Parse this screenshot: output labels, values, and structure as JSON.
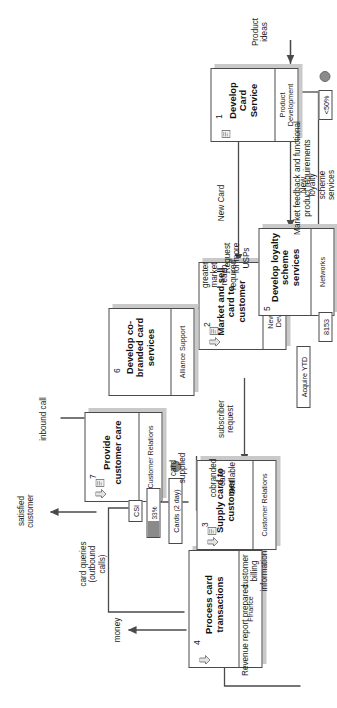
{
  "diagram": {
    "orientation": "rotated-90-ccw",
    "processes": [
      {
        "id": "p1",
        "num": "1",
        "name": "Develop\nCard\nService",
        "owner": "Product\nDevelopment",
        "icons": [
          "document-icon"
        ]
      },
      {
        "id": "p2",
        "num": "2",
        "name": "Market and\nsell card to\ncustomer",
        "owner": "New Business\nDevelopment",
        "icons": [
          "arrow-icon",
          "document-icon"
        ]
      },
      {
        "id": "p3",
        "num": "3",
        "name": "Supply card\nto customer",
        "owner": "Customer\nRelations",
        "icons": [
          "arrow-icon",
          "document-icon"
        ]
      },
      {
        "id": "p4",
        "num": "4",
        "name": "Process card\ntransactions",
        "owner": "Finance",
        "icons": [
          "arrow-icon"
        ]
      },
      {
        "id": "p5",
        "num": "5",
        "name": "Develop\nloyalty\nscheme\nservices",
        "owner": "Networks",
        "icons": []
      },
      {
        "id": "p6",
        "num": "6",
        "name": "Develop co-\nbranded card\nservices",
        "owner": "Alliance Support",
        "icons": []
      },
      {
        "id": "p7",
        "num": "7",
        "name": "Provide\ncustomer\ncare",
        "owner": "Customer\nRelations",
        "icons": [
          "arrow-icon",
          "document-icon"
        ]
      }
    ],
    "kpis": [
      {
        "id": "k1",
        "label": "<50%",
        "kind": "chip"
      },
      {
        "id": "k2",
        "label": "8153",
        "kind": "chip"
      },
      {
        "id": "k3",
        "label": "Acquire YTD",
        "kind": "chip"
      },
      {
        "id": "k4",
        "label": "Cards (2 day)",
        "kind": "chip"
      },
      {
        "id": "k5",
        "label": "CSI",
        "kind": "chip"
      },
      {
        "id": "k6",
        "label": "33%",
        "kind": "gauge",
        "percent": 33
      }
    ],
    "flow_labels": [
      {
        "id": "f01",
        "text": "Product\nideas"
      },
      {
        "id": "f02",
        "text": "New Card"
      },
      {
        "id": "f03",
        "text": "New\nloyalty\nscheme\nservices"
      },
      {
        "id": "f04",
        "text": "Request\nfor more\nUSPs"
      },
      {
        "id": "f05",
        "text": "greater\nmarket\nreach\nrequired"
      },
      {
        "id": "f06",
        "text": "Market feedback and functional\nproduct requirements"
      },
      {
        "id": "f07",
        "text": "subscriber\nrequest"
      },
      {
        "id": "f08",
        "text": "cobranded\ncard\navailable"
      },
      {
        "id": "f09",
        "text": "customer\nbilling\ninformation"
      },
      {
        "id": "f10",
        "text": "card\nsupplied"
      },
      {
        "id": "f11",
        "text": "Revenue report prepared"
      },
      {
        "id": "f12",
        "text": "money"
      },
      {
        "id": "f13",
        "text": "card queries\n(outbound\ncalls)"
      },
      {
        "id": "f14",
        "text": "satisfied\ncustomer"
      },
      {
        "id": "f15",
        "text": "inbound call"
      }
    ],
    "colors": {
      "line": "#4a4a4a",
      "shadow": "#c9c9c9",
      "gauge_fill": "#8a8a8a",
      "dot": "#8b8b8b",
      "text": "#1a1a1a"
    }
  }
}
